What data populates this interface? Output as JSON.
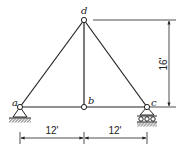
{
  "diagram": {
    "type": "truss",
    "nodes": {
      "a": {
        "label": "a",
        "support": "pin"
      },
      "b": {
        "label": "b",
        "support": "none"
      },
      "c": {
        "label": "c",
        "support": "roller"
      },
      "d": {
        "label": "d",
        "support": "none"
      }
    },
    "members": [
      {
        "from": "a",
        "to": "d"
      },
      {
        "from": "d",
        "to": "c"
      },
      {
        "from": "a",
        "to": "b"
      },
      {
        "from": "b",
        "to": "c"
      },
      {
        "from": "b",
        "to": "d"
      }
    ],
    "dimensions": {
      "height": "16'",
      "span_left": "12'",
      "span_right": "12'"
    },
    "colors": {
      "line": "#222222",
      "background": "#ffffff"
    }
  }
}
